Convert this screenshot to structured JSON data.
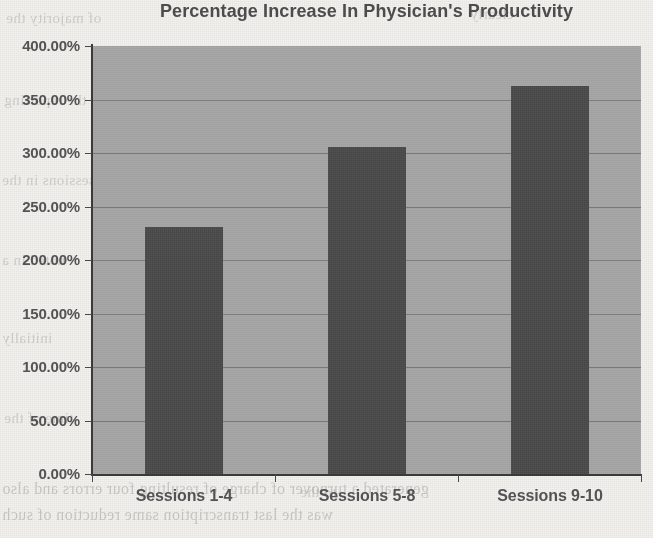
{
  "chart_data": {
    "type": "bar",
    "title": "Percentage Increase In Physician's Productivity",
    "xlabel": "",
    "ylabel": "",
    "categories": [
      "Sessions 1-4",
      "Sessions 5-8",
      "Sessions 9-10"
    ],
    "values": [
      231,
      306,
      363
    ],
    "value_labels": [
      "231.00%",
      "306.00%",
      "363.00%"
    ],
    "ylim": [
      0,
      400
    ],
    "ytick_labels": [
      "0.00%",
      "50.00%",
      "100.00%",
      "150.00%",
      "200.00%",
      "250.00%",
      "300.00%",
      "350.00%",
      "400.00%"
    ],
    "ytick_values": [
      0,
      50,
      100,
      150,
      200,
      250,
      300,
      350,
      400
    ],
    "grid": true,
    "legend": "none",
    "colors": {
      "bar": "#4d4d4d",
      "plot_background": "#a9a9a9",
      "gridline": "#7e7e7e",
      "axis": "#3b3b3b",
      "text": "#555555",
      "title": "#4e4e4e",
      "page_background": "#f3f2ef"
    }
  },
  "background_text": {
    "line1": "of majority the",
    "line2": "clearly",
    "line3": "in the reporting",
    "line4": "identified",
    "line5": "sessions in the",
    "line6": "was remarkably",
    "line7": "noted in a",
    "line8": "initially",
    "line9": "time of the",
    "line10": "generated a turnover of charge of resulting four errors and also",
    "line11": "was the last transcription same reduction of such",
    "line12": "to the"
  }
}
